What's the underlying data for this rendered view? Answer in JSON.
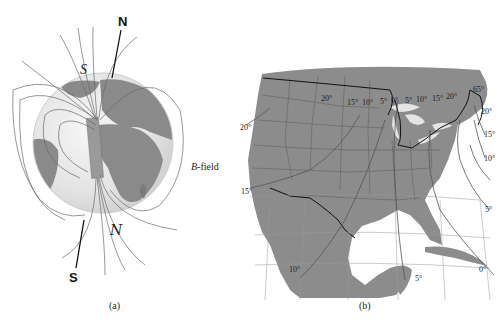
{
  "figure_a": {
    "caption": "(a)",
    "geographic_north_label": "N",
    "geographic_south_label": "S",
    "magnetic_south_label": "S",
    "magnetic_north_label": "N",
    "field_label_italic": "B",
    "field_label_rest": "-field"
  },
  "figure_b": {
    "caption": "(b)",
    "declination_labels": {
      "top_20w": "20°",
      "top_15w": "15°",
      "top_10w": "10°",
      "top_5w": "5°",
      "top_0": "0°",
      "top_5e": "5°",
      "top_10e": "10°",
      "top_15e": "15°",
      "top_20e": "20°",
      "top_right_65": "65°",
      "right_20": "20°",
      "right_15": "15°",
      "right_10": "10°",
      "right_5": "5°",
      "bottom_right_0": "0°",
      "bottom_5": "5°",
      "bottom_10": "10°",
      "left_20": "20°",
      "left_15": "15°"
    }
  },
  "colors": {
    "land": "#8c8c8c",
    "globe_ocean": "#e8e8e8",
    "lines": "#555555",
    "border": "#111111"
  }
}
